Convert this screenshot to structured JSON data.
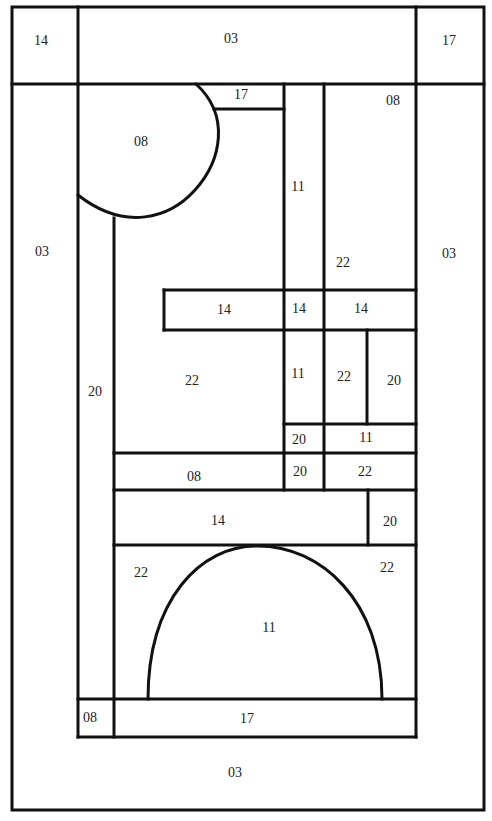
{
  "diagram": {
    "stroke_color": "#111111",
    "background": "#ffffff",
    "regions": [
      {
        "id": "r-top-left",
        "label": "14",
        "x": 41,
        "y": 45
      },
      {
        "id": "r-top-center",
        "label": "03",
        "x": 231,
        "y": 43
      },
      {
        "id": "r-top-right",
        "label": "17",
        "x": 449,
        "y": 45
      },
      {
        "id": "r-left-border",
        "label": "03",
        "x": 42,
        "y": 256
      },
      {
        "id": "r-right-border",
        "label": "03",
        "x": 449,
        "y": 258
      },
      {
        "id": "r-bottom-border",
        "label": "03",
        "x": 235,
        "y": 777
      },
      {
        "id": "r-quarter-circle",
        "label": "08",
        "x": 141,
        "y": 146
      },
      {
        "id": "r-small-band-top",
        "label": "17",
        "x": 241,
        "y": 99
      },
      {
        "id": "r-vertical-11",
        "label": "11",
        "x": 298,
        "y": 191
      },
      {
        "id": "r-top-right-08",
        "label": "08",
        "x": 393,
        "y": 105
      },
      {
        "id": "r-top-right-22",
        "label": "22",
        "x": 343,
        "y": 267
      },
      {
        "id": "r-band-14-left",
        "label": "14",
        "x": 224,
        "y": 314
      },
      {
        "id": "r-band-14-mid",
        "label": "14",
        "x": 299,
        "y": 313
      },
      {
        "id": "r-band-14-right",
        "label": "14",
        "x": 361,
        "y": 313
      },
      {
        "id": "r-left-column-20",
        "label": "20",
        "x": 95,
        "y": 396
      },
      {
        "id": "r-center-22",
        "label": "22",
        "x": 192,
        "y": 385
      },
      {
        "id": "r-mid-11",
        "label": "11",
        "x": 298,
        "y": 378
      },
      {
        "id": "r-mid-22",
        "label": "22",
        "x": 344,
        "y": 381
      },
      {
        "id": "r-mid-20",
        "label": "20",
        "x": 394,
        "y": 385
      },
      {
        "id": "r-small-20-a",
        "label": "20",
        "x": 299,
        "y": 444
      },
      {
        "id": "r-small-11",
        "label": "11",
        "x": 366,
        "y": 442
      },
      {
        "id": "r-band-08",
        "label": "08",
        "x": 194,
        "y": 481
      },
      {
        "id": "r-small-20-b",
        "label": "20",
        "x": 300,
        "y": 476
      },
      {
        "id": "r-small-22",
        "label": "22",
        "x": 365,
        "y": 476
      },
      {
        "id": "r-band-14-lower",
        "label": "14",
        "x": 218,
        "y": 525
      },
      {
        "id": "r-square-20",
        "label": "20",
        "x": 390,
        "y": 526
      },
      {
        "id": "r-arch-left-22",
        "label": "22",
        "x": 141,
        "y": 577
      },
      {
        "id": "r-arch-right-22",
        "label": "22",
        "x": 387,
        "y": 572
      },
      {
        "id": "r-arch-11",
        "label": "11",
        "x": 269,
        "y": 632
      },
      {
        "id": "r-bottom-left-08",
        "label": "08",
        "x": 90,
        "y": 722
      },
      {
        "id": "r-bottom-band-17",
        "label": "17",
        "x": 247,
        "y": 723
      }
    ]
  }
}
